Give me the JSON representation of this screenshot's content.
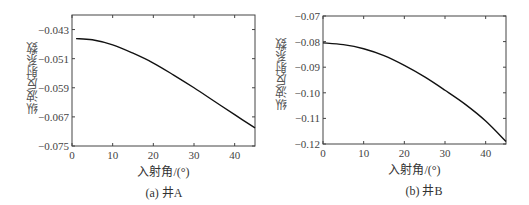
{
  "chart_data": [
    {
      "type": "line",
      "caption": "(a) 井A",
      "xlabel": "入射角/(°)",
      "ylabel": "纵波反射系数",
      "xlim": [
        0,
        45
      ],
      "ylim": [
        -0.075,
        -0.039
      ],
      "xticks": [
        0,
        10,
        20,
        30,
        40
      ],
      "yticks": [
        -0.043,
        -0.051,
        -0.059,
        -0.067,
        -0.075
      ],
      "ytick_labels": [
        "-0.043",
        "-0.051",
        "-0.059",
        "-0.067",
        "-0.075"
      ],
      "grid": false,
      "series": [
        {
          "name": "井A",
          "x": [
            1,
            5,
            10,
            15,
            20,
            25,
            30,
            35,
            40,
            45
          ],
          "y": [
            -0.0455,
            -0.0458,
            -0.0472,
            -0.0495,
            -0.0522,
            -0.0555,
            -0.059,
            -0.0627,
            -0.0664,
            -0.07
          ]
        }
      ]
    },
    {
      "type": "line",
      "caption": "(b) 井B",
      "xlabel": "入射角/(°)",
      "ylabel": "纵波反射系数",
      "xlim": [
        0,
        45
      ],
      "ylim": [
        -0.12,
        -0.07
      ],
      "xticks": [
        0,
        10,
        20,
        30,
        40
      ],
      "yticks": [
        -0.07,
        -0.08,
        -0.09,
        -0.1,
        -0.11,
        -0.12
      ],
      "ytick_labels": [
        "-0.07",
        "-0.08",
        "-0.09",
        "-0.10",
        "-0.11",
        "-0.12"
      ],
      "grid": false,
      "series": [
        {
          "name": "井B",
          "x": [
            0,
            5,
            10,
            15,
            20,
            25,
            30,
            35,
            40,
            45
          ],
          "y": [
            -0.0805,
            -0.0812,
            -0.0828,
            -0.0855,
            -0.0893,
            -0.0938,
            -0.099,
            -0.1045,
            -0.111,
            -0.119
          ]
        }
      ]
    }
  ]
}
